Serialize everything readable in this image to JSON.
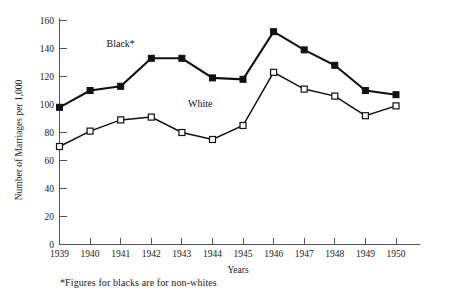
{
  "chart_data": {
    "type": "line",
    "title": "",
    "xlabel": "Years",
    "ylabel": "Number of Marriages per 1,000",
    "categories": [
      "1939",
      "1940",
      "1941",
      "1942",
      "1943",
      "1944",
      "1945",
      "1946",
      "1947",
      "1948",
      "1949",
      "1950"
    ],
    "x": [
      1939,
      1940,
      1941,
      1942,
      1943,
      1944,
      1945,
      1946,
      1947,
      1948,
      1949,
      1950
    ],
    "xlim": [
      1939,
      1950
    ],
    "ylim": [
      0,
      160
    ],
    "yticks": [
      0,
      20,
      40,
      60,
      80,
      100,
      120,
      140,
      160
    ],
    "ytick_labels": [
      "0",
      "20",
      "40",
      "60",
      "80",
      "100",
      "120",
      "140",
      "160"
    ],
    "grid": false,
    "legend_position": "inline-annotation",
    "series": [
      {
        "name": "Black*",
        "marker": "filled-square",
        "values": [
          98,
          110,
          113,
          133,
          133,
          119,
          118,
          152,
          139,
          128,
          110,
          107
        ]
      },
      {
        "name": "White",
        "marker": "open-square",
        "values": [
          70,
          81,
          89,
          91,
          80,
          75,
          85,
          123,
          111,
          106,
          92,
          99
        ]
      }
    ],
    "annotations": [
      {
        "text": "Black*",
        "x": 1941.0,
        "y": 141
      },
      {
        "text": "White",
        "x": 1943.6,
        "y": 98
      }
    ],
    "footnote": "*Figures for blacks are for non-whites",
    "colors": {
      "black_series": "#111111",
      "white_series": "#111111",
      "axis": "#555555",
      "background": "#ffffff"
    }
  }
}
